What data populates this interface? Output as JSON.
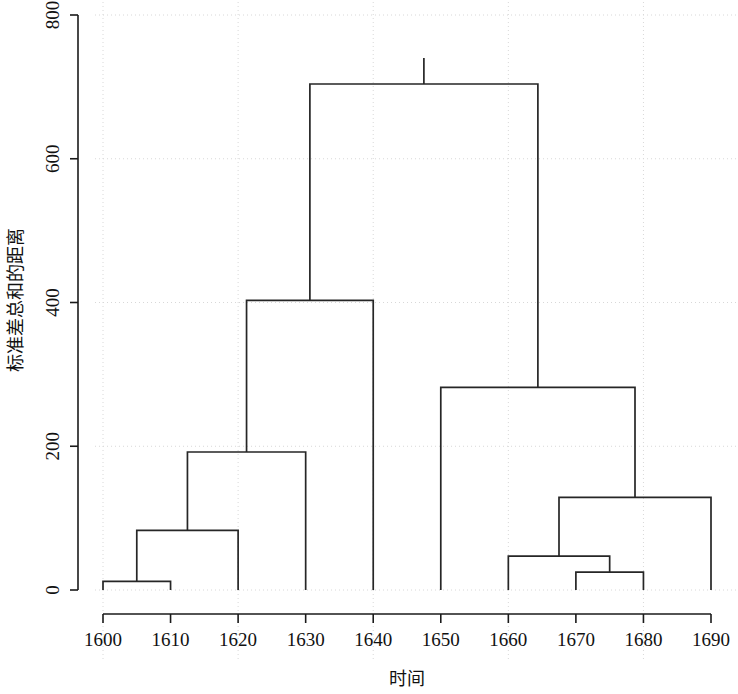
{
  "chart_data": {
    "type": "line",
    "subtype": "dendrogram",
    "title": "",
    "xlabel": "时间",
    "ylabel": "标准差总和的距离",
    "grid": true,
    "legend": null,
    "ylim": [
      0,
      800
    ],
    "yticks": [
      0,
      200,
      400,
      600,
      800
    ],
    "ytick_labels": [
      "0",
      "200",
      "400",
      "600",
      "800"
    ],
    "xticks": [
      1600,
      1610,
      1620,
      1630,
      1640,
      1650,
      1660,
      1670,
      1680,
      1690
    ],
    "xtick_labels": [
      "1600",
      "1610",
      "1620",
      "1630",
      "1640",
      "1650",
      "1660",
      "1670",
      "1680",
      "1690"
    ],
    "leaves": [
      1600,
      1610,
      1620,
      1630,
      1640,
      1650,
      1660,
      1670,
      1680,
      1690
    ],
    "line_color": "#262626",
    "merges": [
      {
        "id": "m1",
        "left": {
          "type": "leaf",
          "x": 1600
        },
        "right": {
          "type": "leaf",
          "x": 1610
        },
        "height": 12
      },
      {
        "id": "m2",
        "left": {
          "type": "node",
          "ref": "m1"
        },
        "right": {
          "type": "leaf",
          "x": 1620
        },
        "height": 83
      },
      {
        "id": "m3",
        "left": {
          "type": "node",
          "ref": "m2"
        },
        "right": {
          "type": "leaf",
          "x": 1630
        },
        "height": 192
      },
      {
        "id": "m4",
        "left": {
          "type": "node",
          "ref": "m3"
        },
        "right": {
          "type": "leaf",
          "x": 1640
        },
        "height": 403
      },
      {
        "id": "m5",
        "left": {
          "type": "leaf",
          "x": 1670
        },
        "right": {
          "type": "leaf",
          "x": 1680
        },
        "height": 25
      },
      {
        "id": "m6",
        "left": {
          "type": "leaf",
          "x": 1660
        },
        "right": {
          "type": "node",
          "ref": "m5"
        },
        "height": 47
      },
      {
        "id": "m7",
        "left": {
          "type": "node",
          "ref": "m6"
        },
        "right": {
          "type": "leaf",
          "x": 1690
        },
        "height": 129
      },
      {
        "id": "m8",
        "left": {
          "type": "leaf",
          "x": 1650
        },
        "right": {
          "type": "node",
          "ref": "m7"
        },
        "height": 282
      },
      {
        "id": "m9",
        "left": {
          "type": "node",
          "ref": "m4"
        },
        "right": {
          "type": "node",
          "ref": "m8"
        },
        "height": 704
      }
    ]
  }
}
